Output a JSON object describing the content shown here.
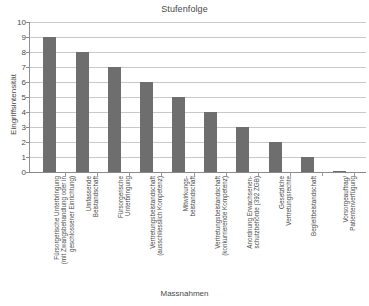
{
  "chart_data": {
    "type": "bar",
    "title": "Stufenfolge",
    "xlabel": "Massnahmen",
    "ylabel": "Eingriffsintensität",
    "ylim": [
      0,
      10
    ],
    "ytick_labels": [
      "0",
      "1",
      "2",
      "3",
      "4",
      "5",
      "6",
      "7",
      "8",
      "9",
      "10"
    ],
    "ytick_values": [
      0,
      1,
      2,
      3,
      4,
      5,
      6,
      7,
      8,
      9,
      10
    ],
    "grid": true,
    "legend": null,
    "bar_color": "#6e6e6e",
    "grid_color": "#c9c9c9",
    "axis_color": "#8a8a8a",
    "categories": [
      "Fürsorgerische Unterbringung\n(mit Zwangsbehandlung oder in\ngeschlossener Einrichtung)",
      "Umfassende\nBeistandschaft",
      "Fürsorgerische\nUnterbringung",
      "Vertretungsbeistandschaft\n(ausschliesslich Kompetenz)",
      "Mitwirkungs-\nbeistandschaft",
      "Vertretungsbeistandschaft\n(konkurrierende Kompetenz)",
      "Anordnung Erwachsenen-\nschutzbehörde (392 ZGB)",
      "Gesetzliche\nVertretungsrechte",
      "Begleitbeistandschaft",
      "Vorsorgeauftrag/\nPatientenverfügung"
    ],
    "values": [
      9,
      8,
      7,
      6,
      5,
      4,
      3,
      2,
      1,
      0.07
    ]
  }
}
